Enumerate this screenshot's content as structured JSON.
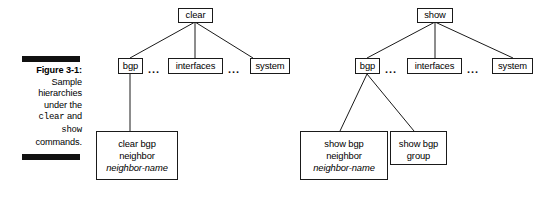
{
  "figure": {
    "caption_label": "Figure 3-1:",
    "caption_line2": "Sample",
    "caption_line3": "hierarchies",
    "caption_line4": "under the",
    "caption_cmd1": "clear",
    "caption_and": " and",
    "caption_cmd2": "show",
    "caption_line7": "commands."
  },
  "trees": {
    "left": {
      "root": "clear",
      "children": [
        {
          "label": "bgp"
        },
        {
          "label": "interfaces"
        },
        {
          "label": "system"
        }
      ],
      "ellipsis1": "...",
      "ellipsis2": "...",
      "leaves": [
        {
          "line1": "clear bgp",
          "line2": "neighbor",
          "line3": "neighbor-name"
        }
      ]
    },
    "right": {
      "root": "show",
      "children": [
        {
          "label": "bgp"
        },
        {
          "label": "interfaces"
        },
        {
          "label": "system"
        }
      ],
      "ellipsis1": "...",
      "ellipsis2": "...",
      "leaves": [
        {
          "line1": "show bgp",
          "line2": "neighbor",
          "line3": "neighbor-name"
        },
        {
          "line1": "show bgp",
          "line2": "group"
        }
      ]
    }
  },
  "colors": {
    "ink": "#1a1a1a",
    "rule": "#111111",
    "paper": "#ffffff"
  }
}
